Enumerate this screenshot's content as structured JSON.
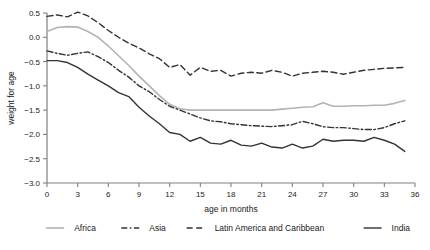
{
  "chart_data": {
    "type": "line",
    "title": "",
    "xlabel": "age in months",
    "ylabel": "weight for age",
    "xlim": [
      0,
      36
    ],
    "ylim": [
      -3.0,
      0.5
    ],
    "xticks": [
      0,
      3,
      6,
      9,
      12,
      15,
      18,
      21,
      24,
      27,
      30,
      33,
      36
    ],
    "xtick_labels": [
      "0",
      "3",
      "6",
      "9",
      "12",
      "15",
      "18",
      "21",
      "24",
      "27",
      "30",
      "33",
      "36"
    ],
    "yticks": [
      0.5,
      0.0,
      -0.5,
      -1.0,
      -1.5,
      -2.0,
      -2.5,
      -3.0
    ],
    "ytick_labels": [
      "0.5",
      "0.0",
      "−0.5",
      "−1.0",
      "−1.5",
      "−2.0",
      "−2.5",
      "−3.0"
    ],
    "grid": false,
    "legend_position": "bottom",
    "x": [
      0,
      1,
      2,
      3,
      4,
      5,
      6,
      7,
      8,
      9,
      10,
      11,
      12,
      13,
      14,
      15,
      16,
      17,
      18,
      19,
      20,
      21,
      22,
      23,
      24,
      25,
      26,
      27,
      28,
      29,
      30,
      31,
      32,
      33,
      34,
      35
    ],
    "series": [
      {
        "name": "Africa",
        "color": "#b3b3b3",
        "style": "solid",
        "values": [
          0.12,
          0.2,
          0.22,
          0.21,
          0.12,
          0.0,
          -0.18,
          -0.38,
          -0.58,
          -0.8,
          -1.0,
          -1.2,
          -1.38,
          -1.47,
          -1.5,
          -1.5,
          -1.5,
          -1.5,
          -1.5,
          -1.5,
          -1.5,
          -1.5,
          -1.5,
          -1.48,
          -1.46,
          -1.44,
          -1.43,
          -1.35,
          -1.42,
          -1.42,
          -1.41,
          -1.41,
          -1.4,
          -1.4,
          -1.36,
          -1.3
        ]
      },
      {
        "name": "Asia",
        "color": "#333333",
        "style": "dashdot",
        "values": [
          -0.28,
          -0.33,
          -0.37,
          -0.33,
          -0.3,
          -0.4,
          -0.52,
          -0.68,
          -0.82,
          -1.0,
          -1.12,
          -1.28,
          -1.42,
          -1.5,
          -1.58,
          -1.66,
          -1.72,
          -1.74,
          -1.78,
          -1.8,
          -1.82,
          -1.83,
          -1.84,
          -1.82,
          -1.8,
          -1.73,
          -1.78,
          -1.84,
          -1.86,
          -1.86,
          -1.88,
          -1.9,
          -1.9,
          -1.86,
          -1.78,
          -1.72
        ]
      },
      {
        "name": "Latin America and Caribbean",
        "color": "#333333",
        "style": "dashed",
        "values": [
          0.43,
          0.46,
          0.42,
          0.52,
          0.44,
          0.3,
          0.14,
          0.0,
          -0.12,
          -0.22,
          -0.34,
          -0.44,
          -0.62,
          -0.56,
          -0.78,
          -0.62,
          -0.7,
          -0.68,
          -0.8,
          -0.74,
          -0.72,
          -0.74,
          -0.68,
          -0.72,
          -0.8,
          -0.74,
          -0.72,
          -0.7,
          -0.72,
          -0.76,
          -0.72,
          -0.68,
          -0.66,
          -0.64,
          -0.63,
          -0.62
        ]
      },
      {
        "name": "India",
        "color": "#333333",
        "style": "solid",
        "values": [
          -0.48,
          -0.48,
          -0.52,
          -0.62,
          -0.76,
          -0.88,
          -1.0,
          -1.14,
          -1.22,
          -1.44,
          -1.62,
          -1.78,
          -1.96,
          -2.0,
          -2.14,
          -2.06,
          -2.18,
          -2.2,
          -2.12,
          -2.22,
          -2.24,
          -2.18,
          -2.26,
          -2.28,
          -2.2,
          -2.28,
          -2.24,
          -2.1,
          -2.14,
          -2.12,
          -2.12,
          -2.14,
          -2.06,
          -2.12,
          -2.2,
          -2.35
        ]
      }
    ],
    "legend": [
      {
        "label": "Africa",
        "color": "#b3b3b3",
        "style": "solid"
      },
      {
        "label": "Asia",
        "color": "#333333",
        "style": "dashdot"
      },
      {
        "label": "Latin America and Caribbean",
        "color": "#333333",
        "style": "dashed"
      },
      {
        "label": "India",
        "color": "#333333",
        "style": "solid"
      }
    ]
  }
}
